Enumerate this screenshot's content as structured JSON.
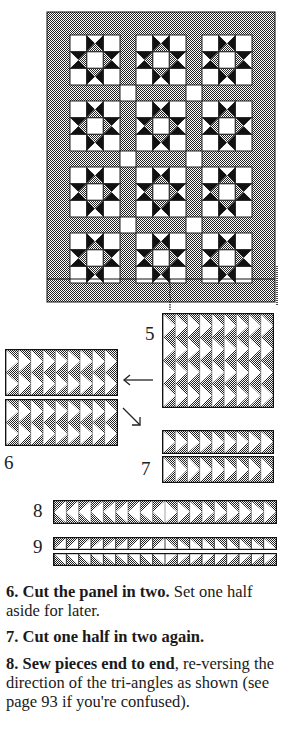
{
  "figure": {
    "quilt": {
      "rows": 4,
      "cols": 3,
      "block": "ohio-star"
    },
    "step_labels": {
      "s5": "5",
      "s6": "6",
      "s7": "7",
      "s8": "8",
      "s9": "9"
    },
    "panel5": {
      "cols": 9,
      "rows": 4
    },
    "half6": {
      "pieces": 2,
      "cols": 9,
      "rows": 2
    },
    "strips7": {
      "pieces": 2,
      "cols": 9
    },
    "strip8": {
      "cols": 18
    },
    "strips9": {
      "pieces": 2,
      "cols": 18
    }
  },
  "colors": {
    "ink": "#111111",
    "gray": "#8a8a8a",
    "paper": "#ffffff"
  },
  "instructions": [
    {
      "num": "6.",
      "bold": "Cut the panel in two.",
      "rest": " Set one half aside for later."
    },
    {
      "num": "7.",
      "bold": "Cut one half in two again.",
      "rest": ""
    },
    {
      "num": "8.",
      "bold": "Sew pieces end to end",
      "rest": ", re-versing the direction of the tri-angles as shown (see page 93 if you're confused)."
    }
  ]
}
